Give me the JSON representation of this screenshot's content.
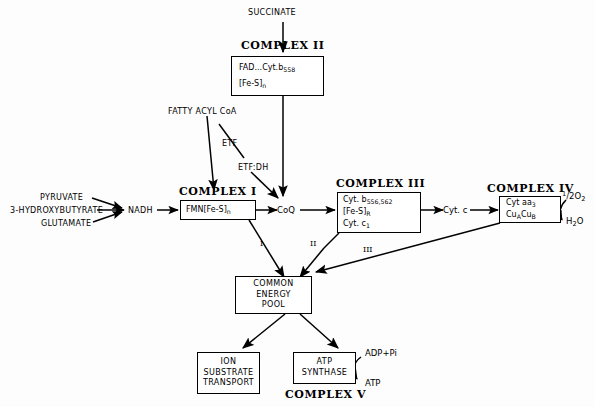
{
  "diagram": {
    "inputs": {
      "succinate": "SUCCINATE",
      "fatty_acyl_coa": "FATTY ACYL CoA",
      "pyruvate": "PYRUVATE",
      "hydroxybutyrate": "3-HYDROXYBUTYRATE",
      "glutamate": "GLUTAMATE",
      "nadh": "NADH"
    },
    "carriers": {
      "etf": "ETF",
      "etf_dh": "ETF:DH",
      "coq": "CoQ",
      "cyt_c": "Cyt. c"
    },
    "complexes": {
      "one": {
        "title": "COMPLEX I",
        "contents": "FMN[Fe-S]",
        "contents_sub": "n"
      },
      "two": {
        "title": "COMPLEX II",
        "line1_main": "FAD...Cyt.b",
        "line1_sub": "558",
        "line2_main": "[Fe-S]",
        "line2_sub": "n"
      },
      "three": {
        "title": "COMPLEX III",
        "line1_main": "Cyt. b",
        "line1_sub": "556,562",
        "line2_main": "[Fe-S]",
        "line2_sub": "R",
        "line3_main": "Cyt. c",
        "line3_sub": "1"
      },
      "four": {
        "title": "COMPLEX IV",
        "line1_main": "Cyt aa",
        "line1_sub": "3",
        "line2_a": "Cu",
        "line2_a_sub": "A",
        "line2_b": "Cu",
        "line2_b_sub": "B"
      },
      "five": {
        "title": "COMPLEX V",
        "box_line1": "ATP",
        "box_line2": "SYNTHASE"
      }
    },
    "energy_pool": {
      "line1": "COMMON ENERGY",
      "line2": "POOL"
    },
    "ion_transport": {
      "line1": "ION",
      "line2": "SUBSTRATE",
      "line3": "TRANSPORT"
    },
    "oxygen": {
      "half": "1",
      "slash": "/",
      "two": "2",
      "species": "O",
      "species_sub": "2"
    },
    "water": {
      "h": "H",
      "sub": "2",
      "o": "O"
    },
    "atp_synthase_io": {
      "substrate": "ADP+Pi",
      "product": "ATP"
    },
    "coupling_site_labels": {
      "site1": "I",
      "site2": "II",
      "site3": "III"
    },
    "colors": {
      "ink": "#000000",
      "background": "#fdfdfd"
    }
  }
}
